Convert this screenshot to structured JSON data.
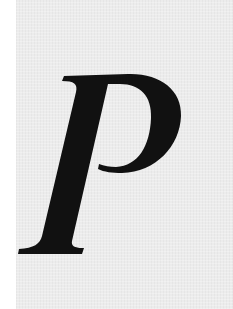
{
  "glyph": {
    "character": "P",
    "style": "italic serif capital letter",
    "color": "#111111"
  },
  "background": {
    "page_color": "#ffffff",
    "texture_color": "#ececec"
  }
}
